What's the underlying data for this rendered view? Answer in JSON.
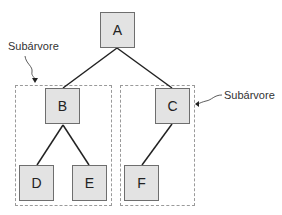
{
  "diagram": {
    "type": "tree",
    "nodes": [
      {
        "id": "A",
        "label": "A"
      },
      {
        "id": "B",
        "label": "B"
      },
      {
        "id": "C",
        "label": "C"
      },
      {
        "id": "D",
        "label": "D"
      },
      {
        "id": "E",
        "label": "E"
      },
      {
        "id": "F",
        "label": "F"
      }
    ],
    "edges": [
      [
        "A",
        "B"
      ],
      [
        "A",
        "C"
      ],
      [
        "B",
        "D"
      ],
      [
        "B",
        "E"
      ],
      [
        "C",
        "F"
      ]
    ],
    "subtrees": [
      {
        "label": "Subárvore",
        "root": "B",
        "members": [
          "B",
          "D",
          "E"
        ]
      },
      {
        "label": "Subárvore",
        "root": "C",
        "members": [
          "C",
          "F"
        ]
      }
    ]
  },
  "colors": {
    "node_fill": "#e3e3e3",
    "node_border": "#6e6e6e",
    "edge": "#222222",
    "dashed": "#9a9a9a"
  }
}
